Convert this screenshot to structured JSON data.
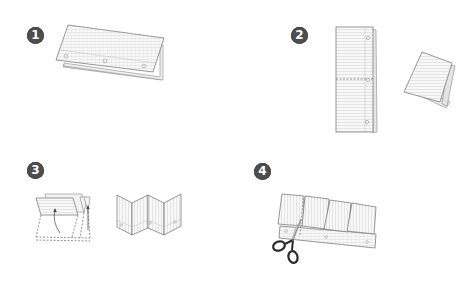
{
  "diagram": {
    "type": "instructional-steps",
    "steps": [
      {
        "number": "1",
        "label": "1",
        "description": "Fold sheet in half lengthwise (hot-dog fold), holes along the bottom edge"
      },
      {
        "number": "2",
        "label": "2",
        "description": "Fold in half, then fold in half again (dashed center line shown)"
      },
      {
        "number": "3",
        "label": "3",
        "description": "Unfold and refold into an accordion (zigzag) with arrows; resulting accordion of four panels"
      },
      {
        "number": "4",
        "label": "4",
        "description": "Cut along the fold lines on the top layer with scissors to form four flaps"
      }
    ],
    "colors": {
      "badge": "#4d4d4d",
      "badge_text": "#ffffff",
      "paper": "#f7f7f7",
      "paper_edge": "#8a8a8a",
      "lines": "#d0d0d0",
      "dash": "#666666",
      "scissors": "#2a2a2a"
    }
  }
}
